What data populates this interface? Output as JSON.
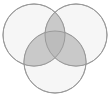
{
  "figure": {
    "name": "three-set-venn-diagram",
    "type": "venn-diagram",
    "title": "",
    "width": 110,
    "height": 100,
    "background_color": "#ffffff",
    "set_count": 3,
    "labels_visible": false
  },
  "chart_data": {
    "type": "venn",
    "title": "",
    "subtitle": "",
    "xlabel": "",
    "ylabel": "",
    "grid": false,
    "legend": "none",
    "sets": [
      {
        "id": "A",
        "label": "",
        "cx": 34,
        "cy": 35,
        "r": 31,
        "fill": "#f0f0f0",
        "stroke": "#9a9a9a",
        "stroke_width": 1,
        "opacity": 0.62
      },
      {
        "id": "B",
        "label": "",
        "cx": 76,
        "cy": 35,
        "r": 31,
        "fill": "#f0f0f0",
        "stroke": "#9a9a9a",
        "stroke_width": 1,
        "opacity": 0.62
      },
      {
        "id": "C",
        "label": "",
        "cx": 55,
        "cy": 62,
        "r": 31,
        "fill": "#f0f0f0",
        "stroke": "#9a9a9a",
        "stroke_width": 1,
        "opacity": 0.62
      }
    ],
    "regions": [
      {
        "id": "A-only",
        "sets": [
          "A"
        ],
        "fill": "#f0f0f0",
        "value": ""
      },
      {
        "id": "B-only",
        "sets": [
          "B"
        ],
        "fill": "#f0f0f0",
        "value": ""
      },
      {
        "id": "C-only",
        "sets": [
          "C"
        ],
        "fill": "#f0f0f0",
        "value": ""
      },
      {
        "id": "A-and-B",
        "sets": [
          "A",
          "B"
        ],
        "fill": "#c9c9c9",
        "value": ""
      },
      {
        "id": "A-and-C",
        "sets": [
          "A",
          "C"
        ],
        "fill": "#c9c9c9",
        "value": ""
      },
      {
        "id": "B-and-C",
        "sets": [
          "B",
          "C"
        ],
        "fill": "#c9c9c9",
        "value": ""
      },
      {
        "id": "A-B-and-C",
        "sets": [
          "A",
          "B",
          "C"
        ],
        "fill": "#bcbcbc",
        "value": ""
      }
    ],
    "colors": {
      "background": "#ffffff",
      "single_fill": "#f0f0f0",
      "double_overlap": "#c9c9c9",
      "triple_overlap": "#bcbcbc",
      "outline": "#9a9a9a"
    }
  }
}
